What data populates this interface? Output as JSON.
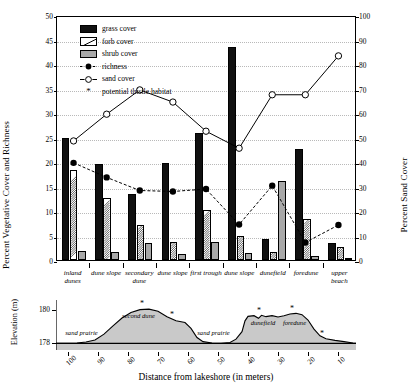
{
  "chart_data": {
    "type": "bar",
    "title": "",
    "ylabel": "Percent Vegetative Cover and Richness",
    "ylabel_right": "Percent Sand Cover",
    "xlabel": "Distance from lakeshore (in meters)",
    "ylim": [
      0,
      50
    ],
    "ylim_right": [
      0,
      100
    ],
    "yticks": [
      0,
      5,
      10,
      15,
      20,
      25,
      30,
      35,
      40,
      45,
      50
    ],
    "yticks_right": [
      0,
      10,
      20,
      30,
      40,
      50,
      60,
      70,
      80,
      90,
      100
    ],
    "grid": true,
    "legend_position": "upper-left",
    "categories": [
      "inland dunes",
      "dune slope",
      "secondary dune",
      "dune slope",
      "first trough",
      "dune slope",
      "dunefield",
      "foredune",
      "upper beach"
    ],
    "series": [
      {
        "name": "grass cover",
        "axis": "left",
        "type": "bar",
        "values": [
          25.0,
          19.5,
          13.5,
          19.7,
          26.0,
          43.5,
          4.3,
          22.7,
          3.5
        ]
      },
      {
        "name": "forb cover",
        "axis": "left",
        "type": "bar",
        "values": [
          18.3,
          12.6,
          7.2,
          3.6,
          10.3,
          5.0,
          1.6,
          8.3,
          2.6
        ]
      },
      {
        "name": "shrub cover",
        "axis": "left",
        "type": "bar",
        "values": [
          1.8,
          1.6,
          3.5,
          1.3,
          3.6,
          1.4,
          16.2,
          0.9,
          0.4
        ]
      },
      {
        "name": "richness",
        "axis": "left",
        "type": "line",
        "values": [
          20.0,
          17.0,
          14.3,
          14.1,
          14.6,
          7.3,
          15.3,
          3.6,
          7.2
        ]
      },
      {
        "name": "sand cover",
        "axis": "right",
        "type": "line",
        "values": [
          49,
          60,
          70,
          65,
          53,
          46,
          68,
          68,
          84
        ]
      }
    ],
    "thistle_habitat_marker": "*",
    "thistle_habitat_label": "potential thistle habitat",
    "elevation_profile": {
      "ylabel": "Elevation (m)",
      "yticks": [
        178,
        180
      ],
      "ylim": [
        177.6,
        180.6
      ],
      "xticks": [
        100,
        90,
        80,
        70,
        60,
        50,
        40,
        30,
        20,
        10
      ],
      "xlim": [
        104,
        4
      ],
      "x_direction": "decreasing",
      "profile": [
        [
          104,
          178.0
        ],
        [
          100,
          178.0
        ],
        [
          97,
          178.02
        ],
        [
          94,
          178.08
        ],
        [
          91,
          178.2
        ],
        [
          88,
          178.55
        ],
        [
          85,
          179.05
        ],
        [
          82,
          179.52
        ],
        [
          79,
          179.85
        ],
        [
          76,
          180.02
        ],
        [
          73,
          180.05
        ],
        [
          70,
          179.92
        ],
        [
          67,
          179.6
        ],
        [
          64,
          179.35
        ],
        [
          61,
          179.25
        ],
        [
          59,
          178.9
        ],
        [
          57,
          178.35
        ],
        [
          55,
          178.1
        ],
        [
          52,
          178.02
        ],
        [
          49,
          178.0
        ],
        [
          46,
          178.05
        ],
        [
          44,
          178.25
        ],
        [
          42,
          178.7
        ],
        [
          41,
          179.35
        ],
        [
          40,
          179.62
        ],
        [
          38,
          179.66
        ],
        [
          36.5,
          179.5
        ],
        [
          35.5,
          179.68
        ],
        [
          34,
          179.6
        ],
        [
          32,
          179.66
        ],
        [
          30,
          179.58
        ],
        [
          28,
          179.66
        ],
        [
          26,
          179.76
        ],
        [
          24,
          179.8
        ],
        [
          22,
          179.72
        ],
        [
          20,
          179.4
        ],
        [
          18,
          178.85
        ],
        [
          16,
          178.45
        ],
        [
          14,
          178.28
        ],
        [
          11,
          178.18
        ],
        [
          8,
          178.1
        ],
        [
          5,
          178.02
        ],
        [
          4,
          178.0
        ]
      ],
      "terrain_labels": [
        {
          "text": "sand prairie",
          "x": 95.5,
          "y": 178.6
        },
        {
          "text": "second dune",
          "x": 76.5,
          "y": 179.62
        },
        {
          "text": "sand prairie",
          "x": 51.5,
          "y": 178.62
        },
        {
          "text": "dunefield",
          "x": 35.0,
          "y": 179.22
        },
        {
          "text": "foredune",
          "x": 24.5,
          "y": 179.22
        }
      ],
      "thistle_stars": [
        {
          "x": 75.0,
          "y": 180.35
        },
        {
          "x": 65.0,
          "y": 179.7
        },
        {
          "x": 36.0,
          "y": 179.96
        },
        {
          "x": 25.0,
          "y": 180.05
        },
        {
          "x": 15.0,
          "y": 178.55
        }
      ]
    }
  },
  "legend": {
    "items": [
      {
        "label": "grass cover",
        "marker": "swatch-grass"
      },
      {
        "label": "forb cover",
        "marker": "swatch-forb"
      },
      {
        "label": "shrub cover",
        "marker": "swatch-shrub"
      },
      {
        "label": "richness",
        "marker": "line-filled-circle"
      },
      {
        "label": "sand cover",
        "marker": "line-open-circle"
      },
      {
        "label": "potential thistle habitat",
        "marker": "asterisk"
      }
    ]
  },
  "colors": {
    "grass": "#111111",
    "forb": "#ffffff",
    "shrub": "#a8a8a8",
    "line": "#000000",
    "grid": "#b9b9b9",
    "terrain_fill": "#c9c9c9"
  }
}
